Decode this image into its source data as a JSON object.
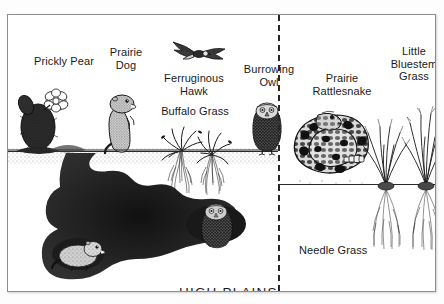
{
  "figure": {
    "title": "HIGH PLAINS",
    "background_color": "#ffffff",
    "ink_color": "#1a1a1a",
    "frame_color": "#8e8e8e",
    "divider_style": "dashed-vertical"
  },
  "labels": [
    {
      "name": "prickly-pear",
      "text": "Prickly Pear",
      "x": 18,
      "y": 40,
      "w": 76,
      "align": "center"
    },
    {
      "name": "prairie-dog",
      "text": "Prairie\nDog",
      "x": 92,
      "y": 31,
      "w": 52,
      "align": "center"
    },
    {
      "name": "ferruginous-hawk",
      "text": "Ferruginous\nHawk",
      "x": 147,
      "y": 57,
      "w": 78,
      "align": "center"
    },
    {
      "name": "buffalo-grass",
      "text": "Buffalo Grass",
      "x": 150,
      "y": 90,
      "w": 74,
      "align": "center"
    },
    {
      "name": "burrowing-owl",
      "text": "Burrowing\nOwl",
      "x": 229,
      "y": 48,
      "w": 64,
      "align": "center"
    },
    {
      "name": "prairie-rattlesnake",
      "text": "Prairie\nRattlesnake",
      "x": 298,
      "y": 57,
      "w": 72,
      "align": "center"
    },
    {
      "name": "little-bluestem-grass",
      "text": "Little\nBluestem\nGrass",
      "x": 377,
      "y": 30,
      "w": 58,
      "align": "center"
    },
    {
      "name": "needle-grass",
      "text": "Needle Grass",
      "x": 291,
      "y": 229,
      "w": 74,
      "align": "left"
    }
  ],
  "title_position": {
    "x": 171,
    "y": 270
  },
  "organisms": [
    {
      "name": "prickly-pear-cactus",
      "kind": "plant",
      "panel": "left"
    },
    {
      "name": "prairie-dog-standing",
      "kind": "animal",
      "panel": "left"
    },
    {
      "name": "ferruginous-hawk-flying",
      "kind": "animal",
      "panel": "left"
    },
    {
      "name": "buffalo-grass-clump",
      "kind": "plant",
      "panel": "left"
    },
    {
      "name": "burrowing-owl-perched",
      "kind": "animal",
      "panel": "left"
    },
    {
      "name": "burrowing-owl-in-burrow",
      "kind": "animal",
      "panel": "left"
    },
    {
      "name": "prairie-dog-in-burrow",
      "kind": "animal",
      "panel": "left"
    },
    {
      "name": "prairie-rattlesnake-coiled",
      "kind": "animal",
      "panel": "right"
    },
    {
      "name": "needle-grass-clump",
      "kind": "plant",
      "panel": "right"
    },
    {
      "name": "little-bluestem-clump",
      "kind": "plant",
      "panel": "right"
    }
  ]
}
